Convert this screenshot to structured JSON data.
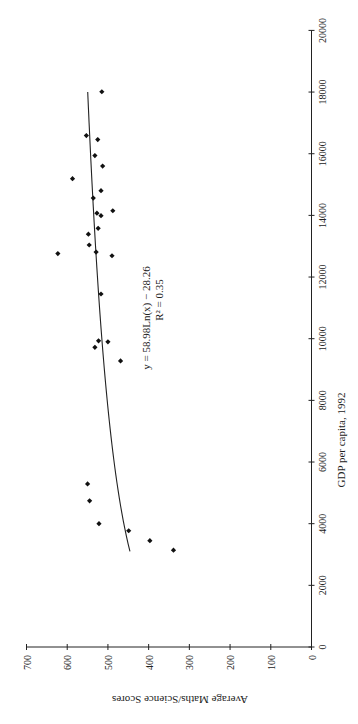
{
  "chart_data": {
    "type": "scatter",
    "orientation_note": "figure rotated 90 degrees counter-clockwise",
    "title": "",
    "xlabel": "GDP per capita, 1992",
    "ylabel": "Average Maths/Science Scores",
    "xlim": [
      0,
      20000
    ],
    "ylim": [
      0,
      700
    ],
    "xticks": [
      0,
      2000,
      4000,
      6000,
      8000,
      10000,
      12000,
      14000,
      16000,
      18000,
      20000
    ],
    "yticks": [
      0,
      100,
      200,
      300,
      400,
      500,
      600,
      700
    ],
    "grid": false,
    "legend": null,
    "series": [
      {
        "name": "Countries",
        "marker": "diamond",
        "points": [
          {
            "x": 3140,
            "y": 339
          },
          {
            "x": 3450,
            "y": 397
          },
          {
            "x": 3770,
            "y": 449
          },
          {
            "x": 4000,
            "y": 522
          },
          {
            "x": 4740,
            "y": 545
          },
          {
            "x": 5290,
            "y": 550
          },
          {
            "x": 9280,
            "y": 469
          },
          {
            "x": 9720,
            "y": 532
          },
          {
            "x": 9900,
            "y": 500
          },
          {
            "x": 9930,
            "y": 523
          },
          {
            "x": 11450,
            "y": 517
          },
          {
            "x": 12690,
            "y": 490
          },
          {
            "x": 12760,
            "y": 623
          },
          {
            "x": 12810,
            "y": 529
          },
          {
            "x": 13040,
            "y": 546
          },
          {
            "x": 13390,
            "y": 548
          },
          {
            "x": 13580,
            "y": 524
          },
          {
            "x": 13990,
            "y": 517
          },
          {
            "x": 14070,
            "y": 527
          },
          {
            "x": 14150,
            "y": 488
          },
          {
            "x": 14560,
            "y": 536
          },
          {
            "x": 14800,
            "y": 517
          },
          {
            "x": 15190,
            "y": 587
          },
          {
            "x": 15600,
            "y": 513
          },
          {
            "x": 15940,
            "y": 532
          },
          {
            "x": 16460,
            "y": 525
          },
          {
            "x": 16590,
            "y": 553
          },
          {
            "x": 18010,
            "y": 515
          }
        ]
      }
    ],
    "trendline": {
      "type": "logarithmic",
      "a": 58.98,
      "b": -28.26,
      "x_range": [
        3100,
        18000
      ],
      "equation_label": "y = 58.98Ln(x) − 28.26",
      "r2_label": "R² = 0.35"
    }
  }
}
